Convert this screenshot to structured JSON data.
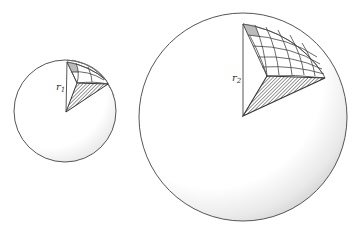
{
  "figure": {
    "spheres": [
      {
        "name": "small-sphere",
        "radius_label": "r",
        "radius_subscript": "1",
        "grid": {
          "rows": 3,
          "cols": 3,
          "shaded_cell": [
            0,
            0
          ]
        }
      },
      {
        "name": "large-sphere",
        "radius_label": "r",
        "radius_subscript": "2",
        "grid": {
          "rows": 5,
          "cols": 6,
          "shaded_cell": [
            0,
            0
          ]
        }
      }
    ],
    "colors": {
      "outline": "#444444",
      "shading": "#bbbbbb",
      "background": "#ffffff"
    }
  }
}
